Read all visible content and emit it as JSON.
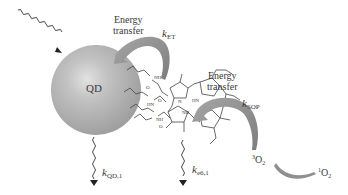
{
  "diagram": {
    "nodes": {
      "quantum_dot": {
        "label": "QD",
        "color": "#b4b4b4"
      },
      "photosensitizer": {
        "label": "porphyrin"
      },
      "triplet_oxygen": {
        "sup": "3",
        "base": "O",
        "sub": "2"
      },
      "singlet_oxygen": {
        "sup": "1",
        "base": "O",
        "sub": "2"
      }
    },
    "energy_transfer_1": {
      "line1": "Energy",
      "line2": "transfer",
      "rate_k": "k",
      "rate_sub": "ET"
    },
    "energy_transfer_2": {
      "line1": "Energy",
      "line2": "transfer",
      "rate_k": "k",
      "rate_sub": "SOP"
    },
    "decay_qd": {
      "rate_k": "k",
      "rate_sub": "QD,1"
    },
    "decay_ps": {
      "rate_k": "k",
      "rate_sub": "e6,1"
    },
    "molecule_labels": [
      "NH",
      "O",
      "HN",
      "O",
      "NH",
      "O",
      "N",
      "HN",
      "NH",
      "N"
    ],
    "colors": {
      "arrow": "#8f8f8f",
      "line": "#444444",
      "text": "#3a3a3a"
    }
  }
}
